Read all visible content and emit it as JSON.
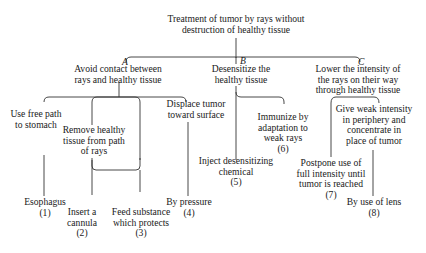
{
  "diagram": {
    "root": {
      "lines": [
        "Treatment of tumor by rays without",
        "destruction of healthy tissue"
      ]
    },
    "branches": [
      {
        "letter": "A",
        "lines": [
          "Avoid contact between",
          "rays and healthy tissue"
        ]
      },
      {
        "letter": "B",
        "lines": [
          "Desensitize the",
          "healthy tissue"
        ]
      },
      {
        "letter": "C",
        "lines": [
          "Lower the intensity of",
          "the rays on their way",
          "through healthy tissue"
        ]
      }
    ],
    "sub_nodes": {
      "use_free_path": [
        "Use free path",
        "to stomach"
      ],
      "remove_tissue": [
        "Remove healthy",
        "tissue from path",
        "of rays"
      ],
      "displace_tumor": [
        "Displace tumor",
        "toward surface"
      ],
      "immunize": [
        "Immunize by",
        "adaptation to",
        "weak rays",
        "(6)"
      ],
      "inject": [
        "Inject desensitizing",
        "chemical",
        "(5)"
      ],
      "weak_intensity": [
        "Give weak intensity",
        "in periphery and",
        "concentrate in",
        "place of tumor"
      ],
      "postpone": [
        "Postpone use of",
        "full intensity until",
        "tumor is reached",
        "(7)"
      ]
    },
    "leaves": {
      "esophagus": [
        "Esophagus",
        "(1)"
      ],
      "cannula": [
        "Insert a",
        "cannula",
        "(2)"
      ],
      "feed_substance": [
        "Feed substance",
        "which protects",
        "(3)"
      ],
      "pressure": [
        "By pressure",
        "(4)"
      ],
      "lens": [
        "By use of lens",
        "(8)"
      ]
    }
  }
}
